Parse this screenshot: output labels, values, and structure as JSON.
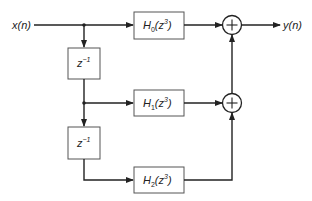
{
  "diagram": {
    "type": "polyphase-filter-block-diagram",
    "input_label": "x(n)",
    "output_label": "y(n)",
    "delays": [
      {
        "label_base": "z",
        "label_exp": "−1"
      },
      {
        "label_base": "z",
        "label_exp": "−1"
      }
    ],
    "filters": [
      {
        "name": "H",
        "sub": "0",
        "arg_open": "(z",
        "arg_exp": "3",
        "arg_close": ")"
      },
      {
        "name": "H",
        "sub": "1",
        "arg_open": "(z",
        "arg_exp": "3",
        "arg_close": ")"
      },
      {
        "name": "H",
        "sub": "2",
        "arg_open": "(z",
        "arg_exp": "3",
        "arg_close": ")"
      }
    ],
    "adders": [
      {
        "symbol": "+"
      },
      {
        "symbol": "+"
      }
    ],
    "colors": {
      "line": "#222222",
      "box_border": "#555555",
      "box_fill": "#ffffff",
      "background": "#ffffff"
    }
  }
}
